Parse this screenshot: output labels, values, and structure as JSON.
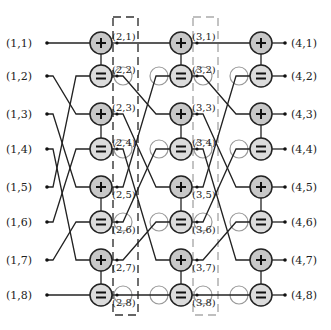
{
  "diagram": {
    "type": "butterfly-factor-graph",
    "colors": {
      "line": "#222222",
      "plus_fill": "#c8c8c8",
      "equal_fill": "#dcdcdc",
      "node_stroke": "#222222",
      "ghost_circle": "#9a9a9a",
      "box_dark": "#333333",
      "box_light": "#aaaaaa"
    },
    "rows_y": [
      43,
      76,
      114,
      149,
      187,
      222,
      260,
      295
    ],
    "inputs": [
      {
        "label": "(1,1)",
        "row": 1
      },
      {
        "label": "(1,2)",
        "row": 2
      },
      {
        "label": "(1,3)",
        "row": 3
      },
      {
        "label": "(1,4)",
        "row": 4
      },
      {
        "label": "(1,5)",
        "row": 5
      },
      {
        "label": "(1,6)",
        "row": 6
      },
      {
        "label": "(1,7)",
        "row": 7
      },
      {
        "label": "(1,8)",
        "row": 8
      }
    ],
    "outputs": [
      {
        "label": "(4,1)",
        "row": 1
      },
      {
        "label": "(4,2)",
        "row": 2
      },
      {
        "label": "(4,3)",
        "row": 3
      },
      {
        "label": "(4,4)",
        "row": 4
      },
      {
        "label": "(4,5)",
        "row": 5
      },
      {
        "label": "(4,6)",
        "row": 6
      },
      {
        "label": "(4,7)",
        "row": 7
      },
      {
        "label": "(4,8)",
        "row": 8
      }
    ],
    "stage_columns": [
      {
        "stage": 2,
        "node_x": 101,
        "labels": [
          "(2,1)",
          "(2,2)",
          "(2,3)",
          "(2,4)",
          "(2,5)",
          "(2,6)",
          "(2,7)",
          "(2,8)"
        ],
        "box_style": "dark-dashed"
      },
      {
        "stage": 3,
        "node_x": 181,
        "labels": [
          "(3,1)",
          "(3,2)",
          "(3,3)",
          "(3,4)",
          "(3,5)",
          "(3,6)",
          "(3,7)",
          "(3,8)"
        ],
        "box_style": "light-dashed"
      },
      {
        "stage": 4,
        "node_x": 261,
        "labels": [],
        "box_style": "none"
      }
    ],
    "node_pattern": [
      "+",
      "=",
      "+",
      "=",
      "+",
      "=",
      "+",
      "="
    ],
    "permutation": {
      "description": "source row i connects to destination row",
      "map": [
        1,
        3,
        5,
        7,
        2,
        4,
        6,
        8
      ]
    }
  }
}
